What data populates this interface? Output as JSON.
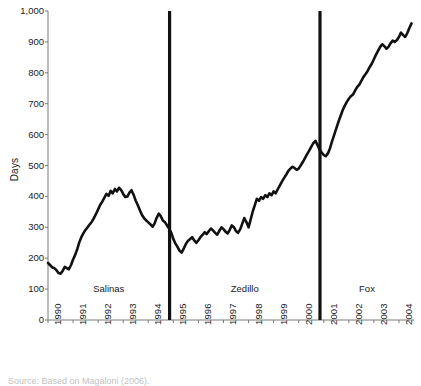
{
  "chart_data": {
    "type": "line",
    "title": "",
    "xlabel": "",
    "ylabel": "Days",
    "ylim": [
      0,
      1000
    ],
    "xlim": [
      1990,
      2004.6
    ],
    "grid": false,
    "legend": "none",
    "y_ticks": [
      "0",
      "100",
      "200",
      "300",
      "400",
      "500",
      "600",
      "700",
      "800",
      "900",
      "1,000"
    ],
    "y_tick_values": [
      0,
      100,
      200,
      300,
      400,
      500,
      600,
      700,
      800,
      900,
      1000
    ],
    "x_ticks": [
      "1990",
      "1991",
      "1992",
      "1993",
      "1994",
      "1995",
      "1996",
      "1997",
      "1998",
      "1999",
      "2000",
      "2001",
      "2002",
      "2003",
      "2004"
    ],
    "x_tick_values": [
      1990,
      1991,
      1992,
      1993,
      1994,
      1995,
      1996,
      1997,
      1998,
      1999,
      2000,
      2001,
      2002,
      2003,
      2004
    ],
    "annotations": [
      {
        "name": "salinas",
        "label": "Salinas",
        "x_start": 1990.0,
        "x_end": 1994.85
      },
      {
        "name": "zedillo",
        "label": "Zedillo",
        "x_start": 1994.85,
        "x_end": 2000.85
      },
      {
        "name": "fox",
        "label": "Fox",
        "x_start": 2000.85,
        "x_end": 2004.6
      }
    ],
    "vertical_rules": [
      {
        "name": "salinas-zedillo-divider",
        "x": 1994.85
      },
      {
        "name": "zedillo-fox-divider",
        "x": 2000.85
      }
    ],
    "series": [
      {
        "name": "days",
        "color": "#111111",
        "x": [
          1990.0,
          1990.08,
          1990.17,
          1990.25,
          1990.33,
          1990.42,
          1990.5,
          1990.58,
          1990.67,
          1990.75,
          1990.83,
          1990.92,
          1991.0,
          1991.08,
          1991.17,
          1991.25,
          1991.33,
          1991.42,
          1991.5,
          1991.58,
          1991.67,
          1991.75,
          1991.83,
          1991.92,
          1992.0,
          1992.08,
          1992.17,
          1992.25,
          1992.33,
          1992.42,
          1992.5,
          1992.58,
          1992.67,
          1992.75,
          1992.83,
          1992.92,
          1993.0,
          1993.08,
          1993.17,
          1993.25,
          1993.33,
          1993.42,
          1993.5,
          1993.58,
          1993.67,
          1993.75,
          1993.83,
          1993.92,
          1994.0,
          1994.08,
          1994.17,
          1994.25,
          1994.33,
          1994.42,
          1994.5,
          1994.58,
          1994.67,
          1994.75,
          1994.83,
          1994.92,
          1995.0,
          1995.08,
          1995.17,
          1995.25,
          1995.33,
          1995.42,
          1995.5,
          1995.58,
          1995.67,
          1995.75,
          1995.83,
          1995.92,
          1996.0,
          1996.08,
          1996.17,
          1996.25,
          1996.33,
          1996.42,
          1996.5,
          1996.58,
          1996.67,
          1996.75,
          1996.83,
          1996.92,
          1997.0,
          1997.08,
          1997.17,
          1997.25,
          1997.33,
          1997.42,
          1997.5,
          1997.58,
          1997.67,
          1997.75,
          1997.83,
          1997.92,
          1998.0,
          1998.08,
          1998.17,
          1998.25,
          1998.33,
          1998.42,
          1998.5,
          1998.58,
          1998.67,
          1998.75,
          1998.83,
          1998.92,
          1999.0,
          1999.08,
          1999.17,
          1999.25,
          1999.33,
          1999.42,
          1999.5,
          1999.58,
          1999.67,
          1999.75,
          1999.83,
          1999.92,
          2000.0,
          2000.08,
          2000.17,
          2000.25,
          2000.33,
          2000.42,
          2000.5,
          2000.58,
          2000.67,
          2000.75,
          2000.83,
          2000.92,
          2001.0,
          2001.08,
          2001.17,
          2001.25,
          2001.33,
          2001.42,
          2001.5,
          2001.58,
          2001.67,
          2001.75,
          2001.83,
          2001.92,
          2002.0,
          2002.08,
          2002.17,
          2002.25,
          2002.33,
          2002.42,
          2002.5,
          2002.58,
          2002.67,
          2002.75,
          2002.83,
          2002.92,
          2003.0,
          2003.08,
          2003.17,
          2003.25,
          2003.33,
          2003.42,
          2003.5,
          2003.58,
          2003.67,
          2003.75,
          2003.83,
          2003.92,
          2004.0,
          2004.08,
          2004.17,
          2004.25,
          2004.33,
          2004.42,
          2004.5
        ],
        "y": [
          185,
          178,
          170,
          168,
          162,
          152,
          150,
          158,
          172,
          168,
          164,
          178,
          196,
          210,
          230,
          252,
          268,
          282,
          292,
          300,
          310,
          318,
          330,
          344,
          358,
          372,
          384,
          396,
          408,
          402,
          418,
          410,
          424,
          416,
          428,
          420,
          408,
          398,
          400,
          412,
          420,
          404,
          386,
          372,
          354,
          340,
          330,
          322,
          316,
          310,
          302,
          312,
          330,
          344,
          336,
          322,
          316,
          306,
          296,
          282,
          262,
          248,
          236,
          224,
          218,
          232,
          246,
          256,
          262,
          268,
          258,
          250,
          258,
          268,
          276,
          284,
          278,
          288,
          296,
          290,
          282,
          276,
          288,
          300,
          294,
          286,
          280,
          292,
          306,
          300,
          288,
          282,
          294,
          312,
          330,
          316,
          300,
          324,
          352,
          372,
          392,
          386,
          398,
          392,
          404,
          398,
          410,
          404,
          416,
          410,
          424,
          436,
          448,
          460,
          470,
          482,
          490,
          496,
          492,
          486,
          490,
          500,
          512,
          524,
          536,
          548,
          560,
          572,
          580,
          566,
          552,
          542,
          534,
          530,
          540,
          556,
          578,
          600,
          620,
          640,
          660,
          678,
          692,
          706,
          716,
          724,
          730,
          742,
          754,
          762,
          774,
          786,
          796,
          806,
          818,
          830,
          844,
          858,
          872,
          884,
          892,
          886,
          878,
          884,
          896,
          904,
          900,
          906,
          916,
          930,
          922,
          916,
          928,
          946,
          960
        ]
      }
    ]
  },
  "caption": {
    "text": "Source: Based on Magaloni (2006)."
  }
}
